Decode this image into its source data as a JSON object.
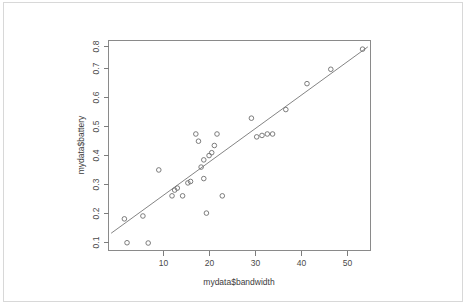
{
  "chart_data": {
    "type": "scatter",
    "title": "",
    "xlabel": "mydata$bandwidth",
    "ylabel": "mydata$battery",
    "xlim": [
      2.5,
      52.0
    ],
    "ylim": [
      0.095,
      0.825
    ],
    "grid": false,
    "legend": null,
    "xticks": [
      10,
      20,
      30,
      40,
      50
    ],
    "xtick_labels": [
      "10",
      "20",
      "30",
      "40",
      "50"
    ],
    "yticks": [
      0.1,
      0.2,
      0.3,
      0.4,
      0.5,
      0.6,
      0.7,
      0.8
    ],
    "ytick_labels": [
      "0.1",
      "0.2",
      "0.3",
      "0.4",
      "0.5",
      "0.6",
      "0.7",
      "0.8"
    ],
    "marker": "open-circle",
    "point_color": "#6e6e6e",
    "line_color": "#767676",
    "x": [
      5.5,
      9.0,
      6.0,
      10.0,
      12.0,
      14.5,
      15.0,
      15.5,
      16.5,
      17.5,
      18.0,
      19.0,
      19.5,
      20.0,
      20.5,
      20.5,
      21.0,
      21.5,
      22.0,
      22.5,
      23.0,
      24.0,
      29.5,
      30.5,
      31.5,
      32.5,
      33.5,
      36.0,
      40.0,
      44.5,
      50.5
    ],
    "y": [
      0.205,
      0.215,
      0.122,
      0.121,
      0.375,
      0.285,
      0.305,
      0.312,
      0.285,
      0.33,
      0.335,
      0.5,
      0.475,
      0.385,
      0.41,
      0.345,
      0.225,
      0.425,
      0.435,
      0.46,
      0.5,
      0.285,
      0.555,
      0.49,
      0.495,
      0.5,
      0.5,
      0.585,
      0.675,
      0.725,
      0.795
    ],
    "fit_line": {
      "name": "linear fit",
      "x": [
        3.0,
        51.5
      ],
      "y": [
        0.155,
        0.803
      ]
    }
  },
  "axes": {
    "x_title": "mydata$bandwidth",
    "y_title": "mydata$battery"
  }
}
